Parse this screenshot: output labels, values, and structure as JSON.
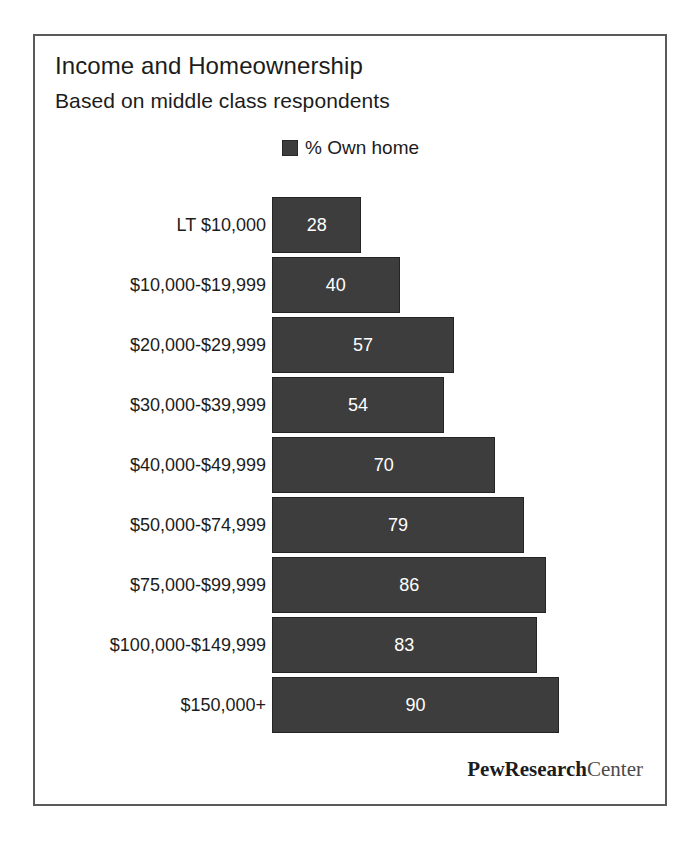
{
  "chart_data": {
    "type": "bar",
    "orientation": "horizontal",
    "title": "Income and Homeownership",
    "subtitle": "Based on middle class respondents",
    "xlabel": "",
    "ylabel": "",
    "xlim": [
      0,
      100
    ],
    "grid": false,
    "legend_position": "top-center",
    "legend": [
      "% Own home"
    ],
    "series": [
      {
        "name": "% Own home",
        "color": "#3d3d3d",
        "values": [
          28,
          40,
          57,
          54,
          70,
          79,
          86,
          83,
          90
        ]
      }
    ],
    "categories": [
      "LT $10,000",
      "$10,000-$19,999",
      "$20,000-$29,999",
      "$30,000-$39,999",
      "$40,000-$49,999",
      "$50,000-$74,999",
      "$75,000-$99,999",
      "$100,000-$149,999",
      "$150,000+"
    ],
    "bars": [
      {
        "category": "LT $10,000",
        "value": 28,
        "label": "28"
      },
      {
        "category": "$10,000-$19,999",
        "value": 40,
        "label": "40"
      },
      {
        "category": "$20,000-$29,999",
        "value": 57,
        "label": "57"
      },
      {
        "category": "$30,000-$39,999",
        "value": 54,
        "label": "54"
      },
      {
        "category": "$40,000-$49,999",
        "value": 70,
        "label": "70"
      },
      {
        "category": "$50,000-$74,999",
        "value": 79,
        "label": "79"
      },
      {
        "category": "$75,000-$99,999",
        "value": 86,
        "label": "86"
      },
      {
        "category": "$100,000-$149,999",
        "value": 83,
        "label": "83"
      },
      {
        "category": "$150,000+",
        "value": 90,
        "label": "90"
      }
    ]
  },
  "legend": {
    "swatch_icon": "legend-swatch-icon",
    "label": "% Own home",
    "color": "#3d3d3d"
  },
  "brand": {
    "primary": "PewResearch",
    "secondary": "Center"
  },
  "colors": {
    "bar_fill": "#3d3d3d",
    "bar_border": "#242424",
    "value_text": "#ffffff",
    "frame_border": "#5a5a5a",
    "background": "#ffffff",
    "text": "#1c1c1c"
  }
}
